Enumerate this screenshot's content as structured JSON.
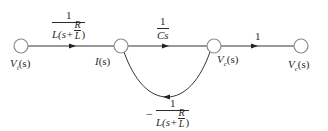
{
  "diagram": {
    "type": "signal-flow-graph",
    "colors": {
      "line": "#333333",
      "node_stroke": "#8c8c8c",
      "node_fill": "#ffffff",
      "text": "#2a2a2a"
    },
    "nodes": [
      {
        "id": "vi",
        "label_main": "V",
        "label_sub": "i",
        "label_arg": "(s)",
        "cx": 21,
        "cy": 46
      },
      {
        "id": "is",
        "label_main": "I",
        "label_sub": "",
        "label_arg": "(s)",
        "cx": 121,
        "cy": 46
      },
      {
        "id": "vc1",
        "label_main": "V",
        "label_sub": "c",
        "label_arg": "(s)",
        "cx": 214,
        "cy": 46
      },
      {
        "id": "vc2",
        "label_main": "V",
        "label_sub": "c",
        "label_arg": "(s)",
        "cx": 301,
        "cy": 46
      }
    ],
    "branches": {
      "b1": {
        "from": "vi",
        "to": "is",
        "gain_num": "1",
        "gain_den_prefix": "L(s+",
        "gain_den_inner_num": "R",
        "gain_den_inner_den": "L",
        "gain_den_suffix": ")"
      },
      "b2": {
        "from": "is",
        "to": "vc1",
        "gain_num": "1",
        "gain_den": "Cs"
      },
      "b3": {
        "from": "vc1",
        "to": "vc2",
        "gain": "1"
      },
      "feedback": {
        "from": "vc1",
        "to": "is",
        "sign": "−",
        "gain_num": "1",
        "gain_den_prefix": "L(s+",
        "gain_den_inner_num": "R",
        "gain_den_inner_den": "L",
        "gain_den_suffix": ")"
      }
    }
  }
}
